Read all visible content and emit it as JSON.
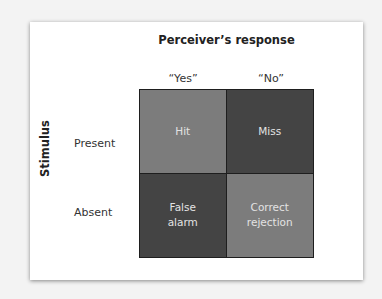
{
  "diagram": {
    "title": "Perceiver’s response",
    "axis_label": "Stimulus",
    "columns": [
      "“Yes”",
      "“No”"
    ],
    "rows": [
      "Present",
      "Absent"
    ],
    "cells": [
      {
        "label": "Hit",
        "shade": "light",
        "color": "#7c7c7c"
      },
      {
        "label": "Miss",
        "shade": "dark",
        "color": "#444444"
      },
      {
        "label": "False\nalarm",
        "shade": "dark",
        "color": "#444444"
      },
      {
        "label": "Correct\nrejection",
        "shade": "light",
        "color": "#7c7c7c"
      }
    ]
  }
}
